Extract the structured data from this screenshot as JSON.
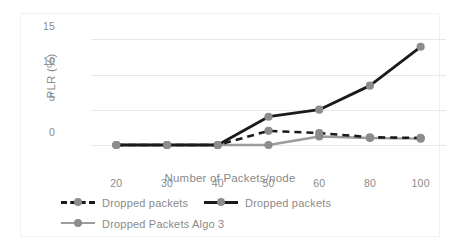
{
  "chart_data": {
    "type": "line",
    "title": "",
    "xlabel": "Number of Packets/node",
    "ylabel": "PLR (%)",
    "categories": [
      "20",
      "30",
      "40",
      "50",
      "60",
      "80",
      "100"
    ],
    "ylim": [
      0,
      15
    ],
    "yticks": [
      "0",
      "5",
      "10",
      "15"
    ],
    "grid": "horizontal",
    "legend_position": "bottom",
    "series": [
      {
        "name": "Dropped packets",
        "style": "dashed",
        "color": "#1a1a1a",
        "marker_color": "#8c8c8c",
        "values": [
          0,
          0,
          0,
          2.0,
          1.7,
          1.1,
          1.0
        ]
      },
      {
        "name": "Dropped packets",
        "style": "solid",
        "color": "#1a1a1a",
        "marker_color": "#8c8c8c",
        "values": [
          0,
          0,
          0,
          4.0,
          5.0,
          8.4,
          13.9
        ]
      },
      {
        "name": "Dropped Packets Algo 3",
        "style": "solid",
        "color": "#9c9c9c",
        "marker_color": "#8c8c8c",
        "values": [
          0,
          0,
          0,
          0,
          1.2,
          1.0,
          0.9
        ]
      }
    ]
  },
  "axis": {
    "yticks": [
      {
        "label": "15",
        "value": 15
      },
      {
        "label": "10",
        "value": 10
      },
      {
        "label": "5",
        "value": 5
      },
      {
        "label": "0",
        "value": 0
      }
    ],
    "xticks": [
      {
        "label": "20"
      },
      {
        "label": "30"
      },
      {
        "label": "40"
      },
      {
        "label": "50"
      },
      {
        "label": "60"
      },
      {
        "label": "80"
      },
      {
        "label": "100"
      }
    ],
    "x_title": "Number of Packets/node",
    "y_title": "PLR (%)"
  },
  "legend": {
    "entries": [
      {
        "label": "Dropped packets",
        "style": "dashed-black"
      },
      {
        "label": "Dropped packets",
        "style": "solid-black"
      },
      {
        "label": "Dropped Packets Algo 3",
        "style": "solid-gray"
      }
    ]
  }
}
